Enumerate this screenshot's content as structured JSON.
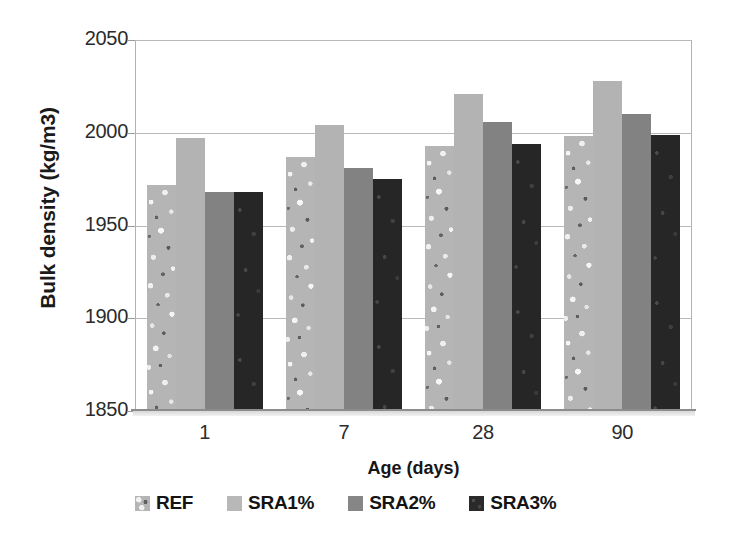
{
  "chart_data": {
    "type": "bar",
    "title": "",
    "xlabel": "Age (days)",
    "ylabel": "Bulk density (kg/m3)",
    "categories": [
      "1",
      "7",
      "28",
      "90"
    ],
    "ylim": [
      1850,
      2050
    ],
    "yticks": [
      1850,
      1900,
      1950,
      2000,
      2050
    ],
    "ytick_labels": [
      "1850",
      "1900",
      "1950",
      "2000",
      "2050"
    ],
    "grid": "horizontal",
    "legend_position": "bottom",
    "series": [
      {
        "name": "REF",
        "values": [
          1972,
          1987,
          1993,
          1998
        ],
        "color": "#b5b5b5",
        "pattern": "speckled"
      },
      {
        "name": "SRA1%",
        "values": [
          1997,
          2004,
          2021,
          2028
        ],
        "color": "#b3b3b3",
        "pattern": "solid"
      },
      {
        "name": "SRA2%",
        "values": [
          1968,
          1981,
          2006,
          2010
        ],
        "color": "#828282",
        "pattern": "solid"
      },
      {
        "name": "SRA3%",
        "values": [
          1968,
          1975,
          1994,
          1999
        ],
        "color": "#262626",
        "pattern": "dark-speckled"
      }
    ]
  },
  "axes": {
    "y_title": "Bulk density (kg/m3)",
    "x_title": "Age (days)",
    "y_ticks": [
      "2050",
      "2000",
      "1950",
      "1900",
      "1850"
    ],
    "x_ticks": [
      "1",
      "7",
      "28",
      "90"
    ]
  },
  "legend": {
    "items": [
      {
        "label": "REF",
        "swatch_class": "ref"
      },
      {
        "label": "SRA1%",
        "swatch_class": "sra1"
      },
      {
        "label": "SRA2%",
        "swatch_class": "sra2"
      },
      {
        "label": "SRA3%",
        "swatch_class": "sra3"
      }
    ]
  }
}
